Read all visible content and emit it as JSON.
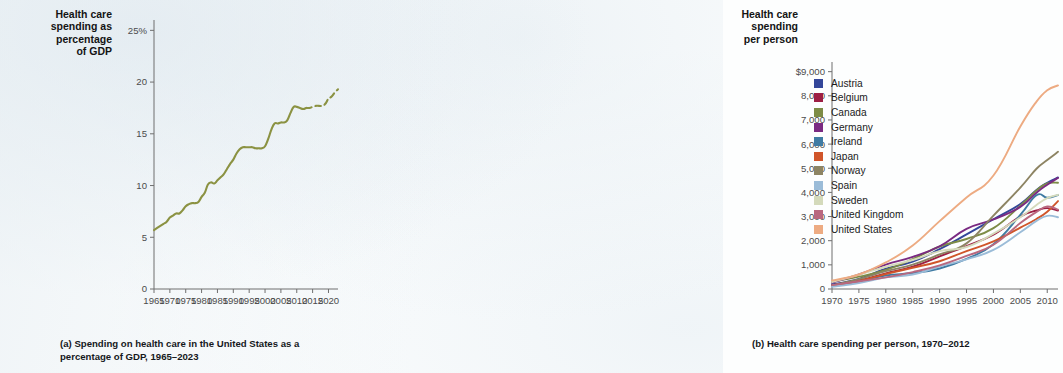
{
  "panel_a": {
    "axis_title": "Health care\nspending as\npercentage\nof GDP",
    "caption_tag": "(a)",
    "caption_text": "Spending on health care in the United States as a percentage of GDP, 1965–2023",
    "line_color": "#8b9242"
  },
  "panel_b": {
    "axis_title": "Health care\nspending\nper person",
    "caption_tag": "(b)",
    "caption_text": "Health care spending per person, 1970–2012"
  },
  "chart_data": [
    {
      "type": "line",
      "id": "panel-a",
      "title": "Spending on health care in the United States as a percentage of GDP, 1965–2023",
      "xlabel": "",
      "ylabel": "Health care spending as percentage of GDP",
      "xlim": [
        1965,
        2023
      ],
      "ylim": [
        0,
        26
      ],
      "xticks": [
        1965,
        1970,
        1975,
        1980,
        1985,
        1990,
        1995,
        2000,
        2005,
        2010,
        2015,
        2020
      ],
      "xticklabels": [
        "1965",
        "1970",
        "1975",
        "1980",
        "1985",
        "1990",
        "1995",
        "2000",
        "2005",
        "2010",
        "2015",
        "2020"
      ],
      "yticks": [
        0,
        5,
        10,
        15,
        20,
        25
      ],
      "yticklabels": [
        "0",
        "5",
        "10",
        "15",
        "20",
        "25%"
      ],
      "grid": false,
      "legend": "none",
      "series": [
        {
          "name": "United States",
          "color": "#8b9242",
          "style": "solid",
          "x": [
            1965,
            1966,
            1967,
            1968,
            1969,
            1970,
            1971,
            1972,
            1973,
            1974,
            1975,
            1976,
            1977,
            1978,
            1979,
            1980,
            1981,
            1982,
            1983,
            1984,
            1985,
            1986,
            1987,
            1988,
            1989,
            1990,
            1991,
            1992,
            1993,
            1994,
            1995,
            1996,
            1997,
            1998,
            1999,
            2000,
            2001,
            2002,
            2003,
            2004,
            2005,
            2006,
            2007,
            2008,
            2009,
            2010,
            2011,
            2012,
            2013
          ],
          "values": [
            5.7,
            5.9,
            6.1,
            6.3,
            6.5,
            6.9,
            7.1,
            7.3,
            7.3,
            7.6,
            8.0,
            8.2,
            8.3,
            8.3,
            8.4,
            8.9,
            9.3,
            10.1,
            10.3,
            10.2,
            10.5,
            10.8,
            11.1,
            11.6,
            12.1,
            12.5,
            13.1,
            13.5,
            13.7,
            13.7,
            13.7,
            13.7,
            13.6,
            13.6,
            13.6,
            13.8,
            14.5,
            15.4,
            16.0,
            16.0,
            16.1,
            16.1,
            16.3,
            17.0,
            17.6,
            17.6,
            17.5,
            17.4,
            17.5
          ]
        },
        {
          "name": "United States (projected)",
          "color": "#8b9242",
          "style": "dashed",
          "x": [
            2013,
            2014,
            2015,
            2016,
            2017,
            2018,
            2019,
            2020,
            2021,
            2022,
            2023
          ],
          "values": [
            17.5,
            17.5,
            17.6,
            17.7,
            17.7,
            17.7,
            17.9,
            18.4,
            18.6,
            19.0,
            19.3
          ]
        }
      ]
    },
    {
      "type": "line",
      "id": "panel-b",
      "title": "Health care spending per person, 1970–2012",
      "xlabel": "",
      "ylabel": "Health care spending per person",
      "xlim": [
        1970,
        2012
      ],
      "ylim": [
        0,
        9400
      ],
      "xticks": [
        1970,
        1975,
        1980,
        1985,
        1990,
        1995,
        2000,
        2005,
        2010
      ],
      "xticklabels": [
        "1970",
        "1975",
        "1980",
        "1985",
        "1990",
        "1995",
        "2000",
        "2005",
        "2010"
      ],
      "yticks": [
        0,
        1000,
        2000,
        3000,
        4000,
        5000,
        6000,
        7000,
        8000,
        9000
      ],
      "yticklabels": [
        "0",
        "1,000",
        "2,000",
        "3,000",
        "4,000",
        "5,000",
        "6,000",
        "7,000",
        "8,000",
        "$9,000"
      ],
      "grid": false,
      "legend": "inside-upper-left",
      "x": [
        1970,
        1975,
        1980,
        1985,
        1990,
        1995,
        2000,
        2005,
        2008,
        2010,
        2012
      ],
      "series": [
        {
          "name": "Austria",
          "color": "#34479a",
          "values": [
            190,
            420,
            840,
            1130,
            1650,
            2260,
            2890,
            3520,
            4100,
            4400,
            4620
          ]
        },
        {
          "name": "Belgium",
          "color": "#9d1f44",
          "values": [
            150,
            350,
            650,
            920,
            1350,
            1780,
            2250,
            3000,
            3250,
            3350,
            3250
          ]
        },
        {
          "name": "Canada",
          "color": "#7d8c46",
          "values": [
            290,
            510,
            790,
            1240,
            1760,
            2070,
            2520,
            3450,
            4080,
            4370,
            4400
          ]
        },
        {
          "name": "Germany",
          "color": "#7a2a82",
          "values": [
            270,
            600,
            1010,
            1330,
            1770,
            2490,
            2880,
            3400,
            3990,
            4320,
            4600
          ]
        },
        {
          "name": "Ireland",
          "color": "#3f7ba3",
          "values": [
            110,
            300,
            560,
            660,
            850,
            1250,
            1850,
            3070,
            3880,
            3780,
            3890
          ]
        },
        {
          "name": "Japan",
          "color": "#d0552a",
          "values": [
            140,
            330,
            620,
            880,
            1150,
            1570,
            1970,
            2540,
            2900,
            3200,
            3640
          ]
        },
        {
          "name": "Norway",
          "color": "#8d8463",
          "values": [
            150,
            410,
            740,
            1010,
            1430,
            1890,
            3040,
            4200,
            4980,
            5340,
            5680
          ]
        },
        {
          "name": "Spain",
          "color": "#9bbcd8",
          "values": [
            95,
            250,
            480,
            600,
            930,
            1230,
            1620,
            2350,
            2820,
            3030,
            2970
          ]
        },
        {
          "name": "Sweden",
          "color": "#d4dabb",
          "values": [
            290,
            590,
            920,
            1200,
            1570,
            1740,
            2290,
            2970,
            3480,
            3760,
            3900
          ]
        },
        {
          "name": "United Kingdom",
          "color": "#b9687f",
          "values": [
            160,
            320,
            480,
            700,
            980,
            1370,
            1830,
            2730,
            3190,
            3420,
            3290
          ]
        },
        {
          "name": "United States",
          "color": "#edab82",
          "values": [
            350,
            600,
            1100,
            1800,
            2810,
            3790,
            4700,
            6730,
            7760,
            8230,
            8430
          ]
        }
      ]
    }
  ],
  "panel_b_legend": [
    {
      "label": "Austria",
      "color": "#34479a"
    },
    {
      "label": "Belgium",
      "color": "#9d1f44"
    },
    {
      "label": "Canada",
      "color": "#7d8c46"
    },
    {
      "label": "Germany",
      "color": "#7a2a82"
    },
    {
      "label": "Ireland",
      "color": "#3f7ba3"
    },
    {
      "label": "Japan",
      "color": "#d0552a"
    },
    {
      "label": "Norway",
      "color": "#8d8463"
    },
    {
      "label": "Spain",
      "color": "#9bbcd8"
    },
    {
      "label": "Sweden",
      "color": "#d4dabb"
    },
    {
      "label": "United Kingdom",
      "color": "#b9687f"
    },
    {
      "label": "United States",
      "color": "#edab82"
    }
  ]
}
